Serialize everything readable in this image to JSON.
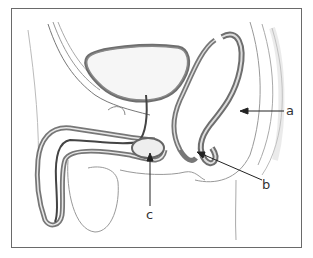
{
  "figure": {
    "labels": [
      {
        "id": "a",
        "text": "a",
        "x": 289,
        "y": 111
      },
      {
        "id": "b",
        "text": "b",
        "x": 265,
        "y": 184
      },
      {
        "id": "c",
        "text": "c",
        "x": 149,
        "y": 214
      }
    ]
  }
}
